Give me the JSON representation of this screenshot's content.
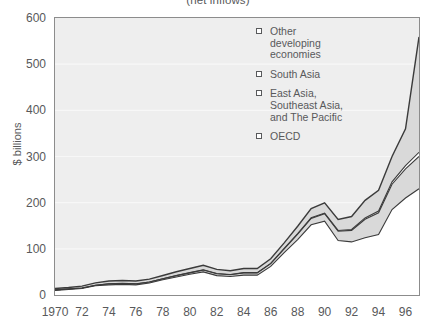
{
  "chart_data": {
    "type": "area",
    "stacked": true,
    "title": "(net inflows)",
    "xlabel": "",
    "ylabel": "$ billions",
    "ylim": [
      0,
      600
    ],
    "xlim": [
      1970,
      1997
    ],
    "ytick_labels": [
      "600",
      "500",
      "400",
      "300",
      "200",
      "100",
      "0"
    ],
    "ytick_values": [
      600,
      500,
      400,
      300,
      200,
      100,
      0
    ],
    "xtick_labels": [
      "1970",
      "72",
      "74",
      "76",
      "78",
      "80",
      "82",
      "84",
      "86",
      "88",
      "90",
      "92",
      "94",
      "96"
    ],
    "xtick_values": [
      1970,
      1972,
      1974,
      1976,
      1978,
      1980,
      1982,
      1984,
      1986,
      1988,
      1990,
      1992,
      1994,
      1996
    ],
    "grid": true,
    "legend_position": "inside-top-right",
    "x": [
      1970,
      1971,
      1972,
      1973,
      1974,
      1975,
      1976,
      1977,
      1978,
      1979,
      1980,
      1981,
      1982,
      1983,
      1984,
      1985,
      1986,
      1987,
      1988,
      1989,
      1990,
      1991,
      1992,
      1993,
      1994,
      1995,
      1996,
      1997
    ],
    "series": [
      {
        "name": "OECD",
        "color": "#ffffff",
        "values": [
          10,
          12,
          14,
          20,
          22,
          23,
          22,
          26,
          33,
          39,
          45,
          50,
          42,
          40,
          43,
          43,
          62,
          92,
          120,
          152,
          160,
          118,
          115,
          124,
          131,
          185,
          210,
          230
        ]
      },
      {
        "name": "East Asia, Southeast Asia, and The Pacific",
        "color": "#d9d9d9",
        "values": [
          1,
          1,
          1,
          1,
          2,
          2,
          2,
          2,
          2,
          3,
          3,
          4,
          4,
          4,
          5,
          5,
          6,
          8,
          12,
          14,
          16,
          20,
          25,
          40,
          47,
          55,
          63,
          70
        ]
      },
      {
        "name": "South Asia",
        "color": "#ffffff",
        "values": [
          0.2,
          0.2,
          0.2,
          0.2,
          0.3,
          0.3,
          0.3,
          0.3,
          0.3,
          0.4,
          0.4,
          0.5,
          0.5,
          0.5,
          0.5,
          0.5,
          0.6,
          0.8,
          1,
          1.2,
          1.5,
          1.8,
          2,
          3,
          4,
          5,
          7,
          9
        ]
      },
      {
        "name": "Other developing economies",
        "color": "#d9d9d9",
        "values": [
          3,
          3,
          4,
          5,
          6,
          6,
          6,
          6,
          7,
          8,
          9,
          10,
          9,
          8,
          9,
          9,
          10,
          12,
          16,
          20,
          22,
          24,
          28,
          38,
          45,
          55,
          80,
          250
        ]
      }
    ],
    "annotations": []
  },
  "legend": {
    "entries": [
      {
        "id": "other-developing-economies",
        "lines": [
          "Other",
          "developing",
          "economies"
        ]
      },
      {
        "id": "south-asia",
        "lines": [
          "South Asia"
        ]
      },
      {
        "id": "east-asia",
        "lines": [
          "East Asia,",
          "Southeast Asia,",
          "and The Pacific"
        ]
      },
      {
        "id": "oecd",
        "lines": [
          "OECD"
        ]
      }
    ]
  },
  "colors": {
    "plot_background": "#eeeeee",
    "band_shaded": "#d9d9d9",
    "band_light": "#ffffff",
    "line": "#3b3b3b",
    "axis": "#8c8c8c",
    "text": "#58595b",
    "gridline": "#f7f7f7"
  }
}
